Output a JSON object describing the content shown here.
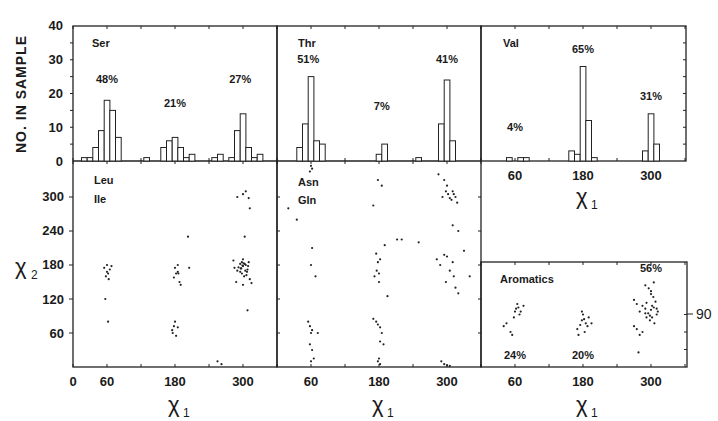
{
  "figure": {
    "y_hist_label": "NO. IN SAMPLE",
    "x_axis_symbol": "χ",
    "x_axis_sub": "1",
    "y_axis_symbol": "χ",
    "y_axis_sub": "2",
    "hist_y_ticks": [
      "40",
      "30",
      "20",
      "10",
      "0"
    ],
    "scatter_y_ticks": [
      "300",
      "240",
      "180",
      "120",
      "60"
    ],
    "x_ticks_left": [
      "0",
      "60",
      "180",
      "300"
    ],
    "x_ticks": [
      "60",
      "180",
      "300"
    ],
    "aromatics_right_tick": "90"
  },
  "chart_data": [
    {
      "type": "bar",
      "title": "Ser",
      "xlabel": "χ1",
      "ylabel": "NO. IN SAMPLE",
      "ylim": [
        0,
        40
      ],
      "xlim": [
        0,
        360
      ],
      "bins_deg": [
        20,
        30,
        40,
        50,
        60,
        70,
        80,
        130,
        160,
        170,
        180,
        190,
        200,
        210,
        250,
        260,
        280,
        290,
        300,
        310,
        320,
        330
      ],
      "values": [
        1,
        1,
        4,
        9,
        18,
        15,
        7,
        1,
        4,
        6,
        7,
        4,
        1,
        2,
        1,
        2,
        1,
        9,
        14,
        4,
        1,
        2
      ],
      "annotations": [
        {
          "text": "48%",
          "x": 60,
          "y": 23
        },
        {
          "text": "21%",
          "x": 180,
          "y": 16
        },
        {
          "text": "27%",
          "x": 295,
          "y": 23
        }
      ]
    },
    {
      "type": "bar",
      "title": "Thr",
      "xlabel": "χ1",
      "ylabel": "NO. IN SAMPLE",
      "ylim": [
        0,
        40
      ],
      "xlim": [
        0,
        360
      ],
      "bins_deg": [
        40,
        50,
        60,
        70,
        80,
        180,
        190,
        250,
        290,
        300,
        310
      ],
      "values": [
        4,
        11,
        25,
        6,
        5,
        2,
        5,
        1,
        11,
        24,
        6
      ],
      "annotations": [
        {
          "text": "51%",
          "x": 55,
          "y": 29
        },
        {
          "text": "7%",
          "x": 185,
          "y": 15
        },
        {
          "text": "41%",
          "x": 300,
          "y": 29
        }
      ]
    },
    {
      "type": "bar",
      "title": "Val",
      "xlabel": "χ1",
      "ylabel": "NO. IN SAMPLE",
      "ylim": [
        0,
        40
      ],
      "xlim": [
        0,
        360
      ],
      "bins_deg": [
        50,
        70,
        80,
        160,
        170,
        180,
        190,
        200,
        290,
        300,
        310
      ],
      "values": [
        1,
        1,
        1,
        3,
        2,
        28,
        12,
        1,
        3,
        14,
        5
      ],
      "annotations": [
        {
          "text": "4%",
          "x": 60,
          "y": 9
        },
        {
          "text": "65%",
          "x": 180,
          "y": 32
        },
        {
          "text": "31%",
          "x": 300,
          "y": 18
        }
      ]
    },
    {
      "type": "scatter",
      "title": "Leu Ile",
      "xlabel": "χ1",
      "ylabel": "χ2",
      "xlim": [
        0,
        360
      ],
      "ylim": [
        0,
        360
      ],
      "x": [
        55,
        60,
        62,
        58,
        65,
        68,
        60,
        63,
        57,
        62,
        180,
        182,
        185,
        178,
        188,
        190,
        185,
        205,
        203,
        186,
        180,
        178,
        176,
        182,
        175,
        185,
        255,
        262,
        290,
        300,
        305,
        310,
        312,
        295,
        298,
        285,
        290,
        295,
        300,
        305,
        310,
        300,
        298,
        302,
        308,
        292,
        296,
        304,
        299,
        301,
        306,
        283,
        288,
        312,
        315,
        300,
        307,
        297,
        309,
        303,
        303,
        308
      ],
      "y": [
        175,
        168,
        165,
        160,
        172,
        178,
        180,
        155,
        120,
        80,
        175,
        165,
        168,
        158,
        150,
        145,
        180,
        175,
        230,
        165,
        80,
        72,
        60,
        55,
        65,
        70,
        10,
        5,
        300,
        305,
        310,
        298,
        280,
        182,
        185,
        175,
        170,
        168,
        178,
        180,
        185,
        190,
        165,
        160,
        172,
        176,
        174,
        170,
        179,
        183,
        162,
        188,
        150,
        155,
        148,
        145,
        168,
        174,
        178,
        182,
        230,
        100
      ],
      "annotations": []
    },
    {
      "type": "scatter",
      "title": "Asn Gln",
      "xlabel": "χ1",
      "ylabel": "χ2",
      "xlim": [
        0,
        360
      ],
      "ylim": [
        0,
        360
      ],
      "x": [
        60,
        62,
        58,
        20,
        35,
        62,
        60,
        68,
        55,
        58,
        62,
        60,
        72,
        58,
        62,
        65,
        60,
        178,
        185,
        170,
        175,
        178,
        182,
        176,
        180,
        172,
        180,
        195,
        190,
        212,
        220,
        250,
        170,
        175,
        178,
        182,
        185,
        182,
        188,
        180,
        178,
        182,
        285,
        295,
        300,
        292,
        302,
        298,
        305,
        310,
        312,
        315,
        318,
        308,
        310,
        320,
        330,
        310,
        300,
        295,
        288,
        282,
        305,
        312,
        298,
        315,
        320,
        340,
        290,
        295,
        300,
        305
      ],
      "y": [
        355,
        350,
        345,
        280,
        260,
        210,
        180,
        160,
        80,
        72,
        65,
        60,
        60,
        40,
        30,
        15,
        10,
        330,
        320,
        285,
        200,
        185,
        190,
        170,
        165,
        160,
        150,
        125,
        215,
        225,
        225,
        220,
        85,
        80,
        75,
        70,
        60,
        45,
        40,
        15,
        10,
        5,
        340,
        330,
        320,
        300,
        305,
        310,
        298,
        310,
        305,
        300,
        290,
        295,
        250,
        240,
        205,
        185,
        195,
        198,
        180,
        190,
        170,
        160,
        150,
        140,
        130,
        160,
        10,
        5,
        3,
        2
      ],
      "annotations": []
    },
    {
      "type": "scatter",
      "title": "Aromatics",
      "xlabel": "χ1",
      "ylabel": "",
      "xlim": [
        0,
        360
      ],
      "ylim": [
        0,
        180
      ],
      "x": [
        40,
        45,
        55,
        58,
        60,
        62,
        64,
        66,
        68,
        70,
        75,
        52,
        170,
        175,
        178,
        180,
        182,
        185,
        188,
        190,
        178,
        183,
        195,
        172,
        270,
        275,
        280,
        285,
        290,
        292,
        295,
        298,
        300,
        302,
        305,
        308,
        310,
        312,
        290,
        296,
        300,
        304,
        300,
        298,
        306,
        292,
        285,
        280,
        275,
        270,
        310,
        302,
        290,
        305,
        278
      ],
      "y": [
        70,
        75,
        55,
        85,
        95,
        100,
        108,
        102,
        90,
        95,
        105,
        60,
        65,
        72,
        80,
        90,
        82,
        75,
        70,
        85,
        95,
        60,
        75,
        55,
        115,
        108,
        95,
        105,
        100,
        110,
        92,
        88,
        98,
        85,
        102,
        112,
        90,
        95,
        140,
        135,
        125,
        120,
        130,
        80,
        75,
        85,
        60,
        55,
        65,
        70,
        100,
        105,
        92,
        145,
        25
      ],
      "annotations": [
        {
          "text": "24%",
          "x": 60,
          "y": 20
        },
        {
          "text": "20%",
          "x": 180,
          "y": 20
        },
        {
          "text": "56%",
          "x": 300,
          "y": 170
        }
      ]
    }
  ]
}
